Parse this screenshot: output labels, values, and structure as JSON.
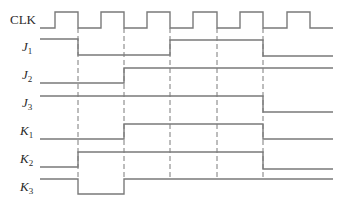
{
  "diagram": {
    "type": "timing-diagram",
    "stroke_color": "#7a7a7a",
    "dash_color": "#7a7a7a",
    "signals": [
      {
        "name": "CLK",
        "letter": "CLK",
        "subscript": "",
        "italic": false,
        "label_x": 10,
        "label_y": 13,
        "high_y": 12,
        "low_y": 28,
        "points": [
          [
            40,
            28
          ],
          [
            55,
            28
          ],
          [
            55,
            12
          ],
          [
            78,
            12
          ],
          [
            78,
            28
          ],
          [
            101,
            28
          ],
          [
            101,
            12
          ],
          [
            124,
            12
          ],
          [
            124,
            28
          ],
          [
            147,
            28
          ],
          [
            147,
            12
          ],
          [
            170,
            12
          ],
          [
            170,
            28
          ],
          [
            193,
            28
          ],
          [
            193,
            12
          ],
          [
            217,
            12
          ],
          [
            217,
            28
          ],
          [
            240,
            28
          ],
          [
            240,
            12
          ],
          [
            263,
            12
          ],
          [
            263,
            28
          ],
          [
            287,
            28
          ],
          [
            287,
            12
          ],
          [
            310,
            12
          ],
          [
            310,
            28
          ],
          [
            333,
            28
          ]
        ]
      },
      {
        "name": "J1",
        "letter": "J",
        "subscript": "1",
        "italic": true,
        "label_x": 22,
        "label_y": 40,
        "points": [
          [
            40,
            39
          ],
          [
            78,
            39
          ],
          [
            78,
            55
          ],
          [
            170,
            55
          ],
          [
            170,
            40
          ],
          [
            263,
            40
          ],
          [
            263,
            56
          ],
          [
            333,
            56
          ]
        ]
      },
      {
        "name": "J2",
        "letter": "J",
        "subscript": "2",
        "italic": true,
        "label_x": 22,
        "label_y": 68,
        "points": [
          [
            40,
            83
          ],
          [
            124,
            83
          ],
          [
            124,
            68
          ],
          [
            333,
            68
          ]
        ]
      },
      {
        "name": "J3",
        "letter": "J",
        "subscript": "3",
        "italic": true,
        "label_x": 22,
        "label_y": 96,
        "points": [
          [
            40,
            96
          ],
          [
            263,
            96
          ],
          [
            263,
            112
          ],
          [
            333,
            112
          ]
        ]
      },
      {
        "name": "K1",
        "letter": "K",
        "subscript": "1",
        "italic": true,
        "label_x": 20,
        "label_y": 124,
        "points": [
          [
            40,
            139
          ],
          [
            124,
            139
          ],
          [
            124,
            124
          ],
          [
            263,
            124
          ],
          [
            263,
            139
          ],
          [
            333,
            139
          ]
        ]
      },
      {
        "name": "K2",
        "letter": "K",
        "subscript": "2",
        "italic": true,
        "label_x": 20,
        "label_y": 152,
        "points": [
          [
            40,
            167
          ],
          [
            78,
            167
          ],
          [
            78,
            152
          ],
          [
            263,
            152
          ],
          [
            263,
            169
          ],
          [
            333,
            169
          ]
        ]
      },
      {
        "name": "K3",
        "letter": "K",
        "subscript": "3",
        "italic": true,
        "label_x": 20,
        "label_y": 180,
        "points": [
          [
            40,
            179
          ],
          [
            78,
            179
          ],
          [
            78,
            194
          ],
          [
            124,
            194
          ],
          [
            124,
            179
          ],
          [
            333,
            179
          ]
        ]
      }
    ],
    "dashed_guides": [
      {
        "x": 78,
        "y1": 28,
        "y2": 180
      },
      {
        "x": 124,
        "y1": 28,
        "y2": 180
      },
      {
        "x": 170,
        "y1": 28,
        "y2": 180
      },
      {
        "x": 217,
        "y1": 28,
        "y2": 180
      },
      {
        "x": 263,
        "y1": 28,
        "y2": 180
      }
    ]
  }
}
